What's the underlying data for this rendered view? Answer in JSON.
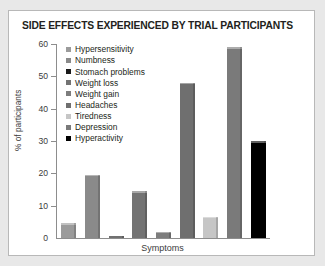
{
  "chart_data": {
    "type": "bar",
    "title": "SIDE EFFECTS EXPERIENCED BY TRIAL PARTICIPANTS",
    "xlabel": "Symptoms",
    "ylabel": "% of participants",
    "ylim": [
      0,
      60
    ],
    "yticks": [
      0,
      10,
      20,
      30,
      40,
      50,
      60
    ],
    "grid": false,
    "legend_position": "inside-top-left",
    "categories": [
      "Hypersensitivity",
      "Numbness",
      "Stomach problems",
      "Weight loss",
      "Weight gain",
      "Headaches",
      "Tiredness",
      "Depression",
      "Hyperactivity"
    ],
    "values": [
      4.5,
      19.5,
      0.5,
      14.5,
      2,
      48,
      6.5,
      59,
      30
    ],
    "colors": [
      "#9b9b9b",
      "#8a8a8a",
      "#1a1a1a",
      "#737373",
      "#7d7d7d",
      "#6f6f6f",
      "#c6c6c6",
      "#7a7a7a",
      "#000000"
    ],
    "series": [
      {
        "name": "Hypersensitivity",
        "value": 4.5,
        "color": "#9b9b9b"
      },
      {
        "name": "Numbness",
        "value": 19.5,
        "color": "#8a8a8a"
      },
      {
        "name": "Stomach problems",
        "value": 0.5,
        "color": "#1a1a1a"
      },
      {
        "name": "Weight loss",
        "value": 14.5,
        "color": "#737373"
      },
      {
        "name": "Weight gain",
        "value": 2,
        "color": "#7d7d7d"
      },
      {
        "name": "Headaches",
        "value": 48,
        "color": "#6f6f6f"
      },
      {
        "name": "Tiredness",
        "value": 6.5,
        "color": "#c6c6c6"
      },
      {
        "name": "Depression",
        "value": 59,
        "color": "#7a7a7a"
      },
      {
        "name": "Hyperactivity",
        "value": 30,
        "color": "#000000"
      }
    ]
  }
}
